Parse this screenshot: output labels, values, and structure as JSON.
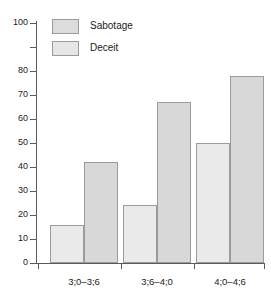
{
  "chart_data": {
    "type": "bar",
    "title": "",
    "subtitle": "",
    "xlabel": "",
    "ylabel": "",
    "categories": [
      "3;0–3;6",
      "3;6–4;0",
      "4;0–4;6"
    ],
    "series": [
      {
        "name": "Sabotage",
        "values": [
          16,
          24,
          50
        ],
        "color": "#eaeaea"
      },
      {
        "name": "Deceit",
        "values": [
          42,
          67,
          78
        ],
        "color": "#d8d8d8"
      }
    ],
    "ylim": [
      0,
      100
    ],
    "ytick_values": [
      0,
      10,
      20,
      30,
      40,
      50,
      60,
      70,
      80,
      90,
      100
    ],
    "ytick_labels": [
      "0",
      "10",
      "20",
      "30",
      "40",
      "50",
      "60",
      "70",
      "80",
      "",
      "100"
    ],
    "grid": false,
    "legend_position": "top-left",
    "bar_grouping": "adjacent-pairs",
    "annotations": []
  },
  "legend": {
    "entries": [
      {
        "label": "Sabotage",
        "swatch_color": "#dcdcdc"
      },
      {
        "label": "Deceit",
        "swatch_color": "#e6e6e6"
      }
    ]
  },
  "axes": {
    "y": {
      "labels": [
        "100",
        "80",
        "70",
        "60",
        "50",
        "40",
        "30",
        "20",
        "10",
        "0"
      ]
    },
    "x": {
      "labels": [
        "3;0–3;6",
        "3;6–4;0",
        "4;0–4;6"
      ]
    }
  },
  "colors": {
    "axis": "#5a5a5a",
    "bar_border": "#9b9b9b",
    "sabotage_fill": "#eaeaea",
    "deceit_fill": "#d8d8d8",
    "text": "#1a1a1a",
    "background": "#ffffff"
  }
}
